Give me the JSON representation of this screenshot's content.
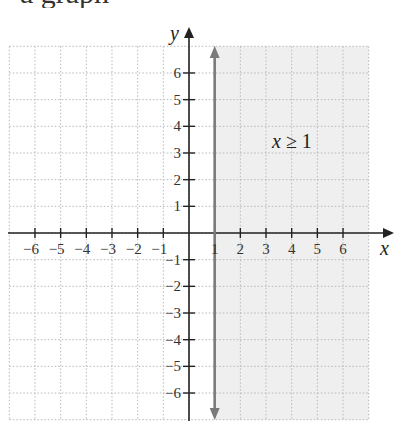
{
  "heading_fragment": "a graph",
  "chart_data": {
    "type": "inequality-graph",
    "title": "",
    "inequality": "x ≥ 1",
    "boundary": {
      "orientation": "vertical",
      "x": 1,
      "style": "solid",
      "color": "#7a7a7a",
      "arrows": "both"
    },
    "shaded_region": {
      "description": "x >= 1",
      "x_from": 1,
      "x_to": 7,
      "y_from": -7,
      "y_to": 7,
      "color": "#efefef"
    },
    "xlabel": "x",
    "ylabel": "y",
    "xlim": [
      -7,
      7
    ],
    "ylim": [
      -7,
      7
    ],
    "grid": true,
    "grid_style": "dotted",
    "x_ticks": [
      -6,
      -5,
      -4,
      -3,
      -2,
      -1,
      1,
      2,
      3,
      4,
      5,
      6
    ],
    "y_ticks": [
      -6,
      -5,
      -4,
      -3,
      -2,
      -1,
      1,
      2,
      3,
      4,
      5,
      6
    ],
    "x_tick_labels": [
      "−6",
      "−5",
      "−4",
      "−3",
      "−2",
      "−1",
      "1",
      "2",
      "3",
      "4",
      "5",
      "6"
    ],
    "y_tick_labels": [
      "−6",
      "−5",
      "−4",
      "−3",
      "−2",
      "−1",
      "1",
      "2",
      "3",
      "4",
      "5",
      "6"
    ],
    "annotation": {
      "text": "x ≥ 1",
      "x": 3.5,
      "y": 3.5
    }
  },
  "colors": {
    "axis": "#222222",
    "grid": "#b8b8b8",
    "shade": "#efefef",
    "boundary": "#7a7a7a"
  }
}
